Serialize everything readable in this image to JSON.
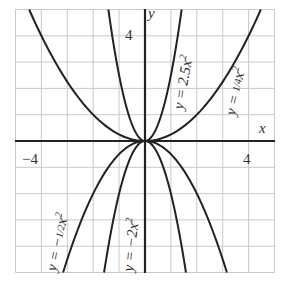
{
  "chart_data": {
    "type": "line",
    "title": "",
    "xlabel": "x",
    "ylabel": "y",
    "xlim": [
      -5,
      5
    ],
    "ylim": [
      -5,
      5
    ],
    "grid": true,
    "grid_step": 1,
    "tick_labels": {
      "x": [
        {
          "value": -4,
          "label": "-4"
        },
        {
          "value": 4,
          "label": "4"
        }
      ],
      "y": [
        {
          "value": 4,
          "label": "4"
        }
      ]
    },
    "series": [
      {
        "name": "y = 2.5x²",
        "coef": 2.5,
        "label_text": "y = 2.5x",
        "label_sup": "2"
      },
      {
        "name": "y = (1/4)x²",
        "coef": 0.25,
        "label_text": "y = ",
        "label_frac": "1/4",
        "label_tail": "x",
        "label_sup": "2"
      },
      {
        "name": "y = -(1/2)x²",
        "coef": -0.5,
        "label_text": "y = −",
        "label_frac": "1/2",
        "label_tail": "x",
        "label_sup": "2"
      },
      {
        "name": "y = -2x²",
        "coef": -2,
        "label_text": "y = −2x",
        "label_sup": "2"
      }
    ],
    "legend": "none (labels placed along curves)"
  },
  "labels": {
    "x_axis": "x",
    "y_axis": "y",
    "tick_x_neg4": "−4",
    "tick_x_pos4": "4",
    "tick_y_pos4": "4",
    "eq_2_5": {
      "main": "y = 2.5x",
      "sup": "2"
    },
    "eq_1_4": {
      "pre": "y = ",
      "frac": "1/4",
      "tail": "x",
      "sup": "2"
    },
    "eq_neg_1_2": {
      "pre": "y = −",
      "frac": "1/2",
      "tail": "x",
      "sup": "2"
    },
    "eq_neg_2": {
      "main": "y = −2x",
      "sup": "2"
    }
  }
}
